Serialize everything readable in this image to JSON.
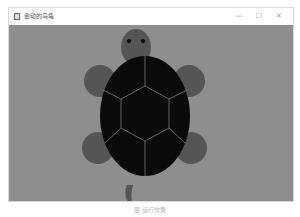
{
  "window": {
    "title": "会动的乌龟",
    "controls": {
      "minimize": "—",
      "maximize": "☐",
      "close": "✕"
    }
  },
  "canvas": {
    "background_color": "#8e8e8e",
    "limb_color": "#555555",
    "shell_color": "#0a0a0a",
    "shell_line_color": "#9a9a9a"
  },
  "caption": "图 运行效果"
}
